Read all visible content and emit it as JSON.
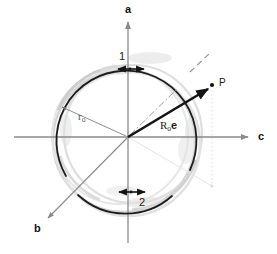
{
  "figure": {
    "type": "vector-diagram",
    "background_color": "#ffffff",
    "width": 277,
    "height": 254
  },
  "axes": {
    "vertical": {
      "name": "a-axis",
      "label": "a",
      "direction": "up",
      "color": "#8a8a8a",
      "label_position": {
        "x": 125,
        "y": 4
      }
    },
    "horizontal": {
      "name": "c-axis",
      "label": "c",
      "direction": "right",
      "color": "#8a8a8a",
      "label_position": {
        "x": 258,
        "y": 131
      }
    },
    "oblique": {
      "name": "b-axis",
      "label": "b",
      "direction": "down-left",
      "color": "#8a8a8a",
      "label_position": {
        "x": 34,
        "y": 223
      }
    }
  },
  "origin": {
    "x": 128,
    "y": 137
  },
  "circle": {
    "name": "reference-circle",
    "radius": 70,
    "color": "#1c1c1c",
    "stroke_width": 1.7,
    "gaps": [
      "upper-left",
      "lower-right"
    ]
  },
  "ghost_circles": {
    "name": "offset-ghost-circles",
    "color": "#cfcfcf",
    "count": 3
  },
  "annotations": {
    "top_marker": {
      "label": "1",
      "kind": "double-headed-arrow",
      "position": {
        "x": 119,
        "y": 51
      }
    },
    "bottom_marker": {
      "label": "2",
      "kind": "double-headed-arrow",
      "position": {
        "x": 139,
        "y": 197
      }
    },
    "radius_label": {
      "label": "r",
      "subscript": "o",
      "position": {
        "x": 78,
        "y": 111
      },
      "color": "#555555"
    },
    "vector_label": {
      "label": "R",
      "subscript": "o",
      "vector_symbol": "e",
      "position": {
        "x": 160,
        "y": 122
      }
    },
    "point_label": {
      "label": "P",
      "position": {
        "x": 219,
        "y": 80
      },
      "marker_position": {
        "x": 212,
        "y": 85
      }
    }
  },
  "guides": {
    "dash_dot_ray": {
      "name": "dash-dot-bisector",
      "angle_deg": 45,
      "color": "#9a9a9a"
    },
    "dashed_segment": {
      "name": "short-dashed-segment",
      "color": "#8a8a8a"
    },
    "dotted_projection": {
      "name": "dotted-projection-lines",
      "color": "#dcdcdc"
    }
  },
  "colors": {
    "ink": "#1c1c1c",
    "axis_gray": "#8a8a8a",
    "faint_gray": "#cfcfcf",
    "very_faint": "#e4e4e4"
  }
}
